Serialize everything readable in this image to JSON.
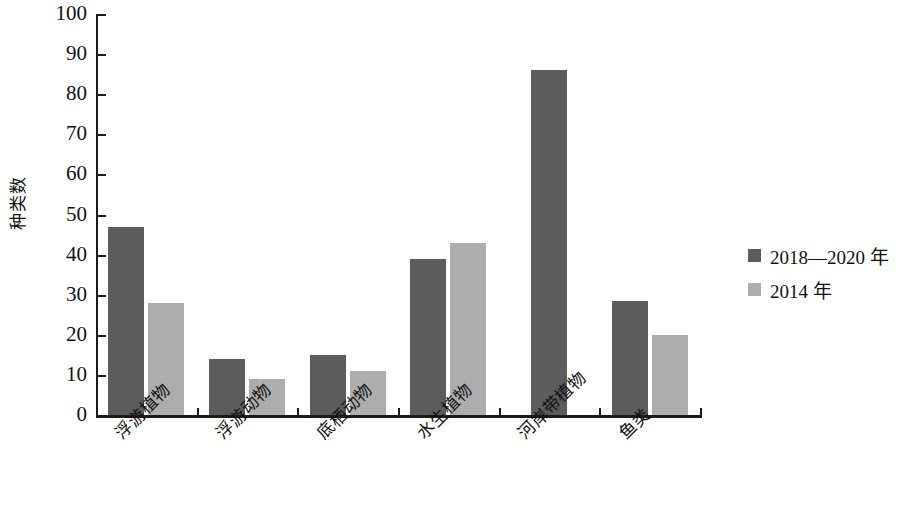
{
  "chart_data": {
    "type": "bar",
    "title": "",
    "subtitle": "",
    "xlabel": "",
    "ylabel": "种类数",
    "ylim": [
      0,
      100
    ],
    "ytick_interval": 10,
    "yticks": [
      100,
      90,
      80,
      70,
      60,
      50,
      40,
      30,
      20,
      10,
      0
    ],
    "grid": false,
    "legend_position": "right",
    "categories": [
      "浮游植物",
      "浮游动物",
      "底栖动物",
      "水生植物",
      "河岸带植物",
      "鱼类"
    ],
    "series": [
      {
        "name": "2018—2020 年",
        "color": "#5c5c5c",
        "values": [
          47,
          14,
          15,
          39,
          86,
          28.5
        ]
      },
      {
        "name": "2014 年",
        "color": "#adadad",
        "values": [
          28,
          9,
          11,
          43,
          0,
          20
        ]
      }
    ]
  },
  "legend": {
    "items": [
      {
        "label": "2018—2020 年",
        "swatch": "series-0"
      },
      {
        "label": "2014 年",
        "swatch": "series-1"
      }
    ]
  },
  "colors": {
    "series_dark": "#5c5c5c",
    "series_light": "#adadad",
    "axis": "#1b1b1b",
    "text": "#111111",
    "background": "#ffffff"
  }
}
